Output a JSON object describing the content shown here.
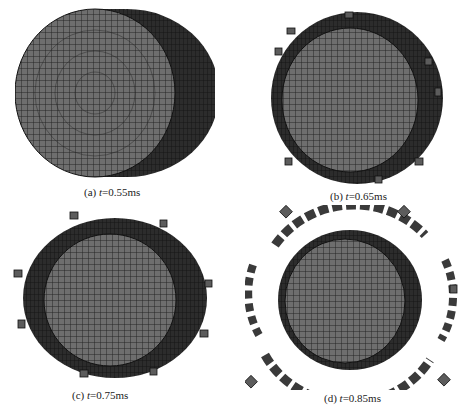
{
  "figure": {
    "panels": [
      {
        "id": "a",
        "label": "(a)",
        "var": "t",
        "value": "=0.55ms",
        "description": "intact cylinder mesh"
      },
      {
        "id": "b",
        "label": "(b)",
        "var": "t",
        "value": "=0.65ms",
        "description": "cylinder surface fragmenting"
      },
      {
        "id": "c",
        "label": "(c)",
        "var": "t",
        "value": "=0.75ms",
        "description": "fragments expanding"
      },
      {
        "id": "d",
        "label": "(d)",
        "var": "t",
        "value": "=0.85ms",
        "description": "fragments dispersed"
      }
    ],
    "colors": {
      "mesh_face": "#6b6b6b",
      "mesh_dark": "#2a2a2a",
      "grid_line": "#1a1a1a",
      "fragment": "#5a5a5a"
    }
  }
}
